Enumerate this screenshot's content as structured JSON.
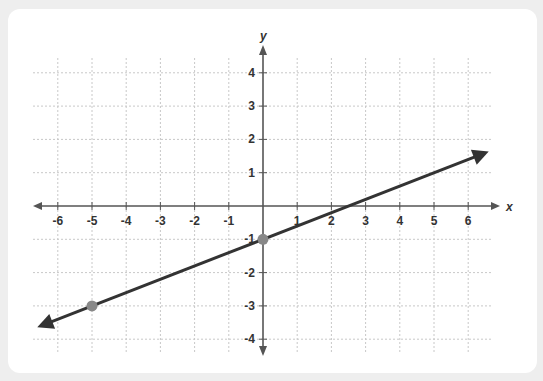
{
  "chart_data": {
    "type": "line",
    "title": "",
    "xlabel": "x",
    "ylabel": "y",
    "xlim": [
      -6.7,
      6.9
    ],
    "ylim": [
      -4.4,
      4.5
    ],
    "grid": true,
    "x_ticks": [
      -6,
      -5,
      -4,
      -3,
      -2,
      -1,
      1,
      2,
      3,
      4,
      5,
      6
    ],
    "y_ticks": [
      4,
      3,
      2,
      1,
      -1,
      -2,
      -3,
      -4
    ],
    "series": [
      {
        "name": "line",
        "equation": "y = 0.4x - 1",
        "slope": 0.4,
        "intercept": -1,
        "color": "#333333",
        "arrows_both_ends": true,
        "x_range": [
          -6.6,
          6.6
        ]
      }
    ],
    "points": [
      {
        "x": 0,
        "y": -1,
        "color": "#888888"
      },
      {
        "x": -5,
        "y": -3,
        "color": "#888888"
      }
    ]
  },
  "colors": {
    "background": "#eeeeee",
    "card": "#ffffff",
    "axis": "#555555",
    "grid": "#c8c8c8",
    "line": "#333333",
    "point": "#888888"
  }
}
